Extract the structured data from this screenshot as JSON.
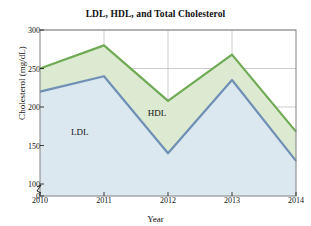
{
  "chart_data": {
    "type": "area",
    "title": "LDL, HDL, and Total Cholesterol",
    "xlabel": "Year",
    "ylabel": "Cholesterol (mg/dL)",
    "categories": [
      "2010",
      "2011",
      "2012",
      "2013",
      "2014"
    ],
    "x": [
      2010,
      2011,
      2012,
      2013,
      2014
    ],
    "series": [
      {
        "name": "LDL",
        "values": [
          220,
          240,
          140,
          235,
          130
        ],
        "fill": "#dce8f0",
        "stroke": "#6f8fb5"
      },
      {
        "name": "Total Cholesterol",
        "values": [
          250,
          280,
          208,
          268,
          168
        ],
        "fill": "#dcead2",
        "stroke": "#6faa55"
      }
    ],
    "band_label": "HDL",
    "ylim": [
      0,
      300
    ],
    "xlim": [
      2010,
      2014
    ],
    "yticks": [
      0,
      100,
      150,
      200,
      250,
      300
    ],
    "ytick_labels": [
      "0",
      "100",
      "150",
      "200",
      "250",
      "300"
    ],
    "xticks": [
      2010,
      2011,
      2012,
      2013,
      2014
    ],
    "axis_break": true,
    "axis_break_between": [
      0,
      100
    ],
    "grid": true,
    "legend": "inline-annotations",
    "annotations": [
      {
        "text": "LDL",
        "x": 2010.62,
        "y": 167
      },
      {
        "text": "HDL",
        "x": 2011.83,
        "y": 192
      }
    ],
    "colors": {
      "grid": "#b8b8b8",
      "frame": "#808080",
      "text": "#101010",
      "background": "#ffffff"
    }
  }
}
